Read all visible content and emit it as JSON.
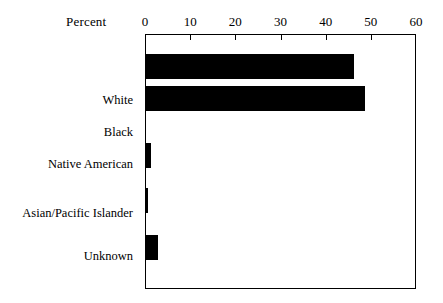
{
  "chart_data": {
    "type": "bar",
    "orientation": "horizontal",
    "title": "",
    "subtitle": "",
    "xlabel": "Percent",
    "ylabel": "",
    "categories": [
      "White",
      "Black",
      "Native American",
      "Asian/Pacific Islander",
      "Unknown"
    ],
    "values": [
      46.4,
      48.8,
      1.1,
      0.4,
      2.6
    ],
    "series": [
      {
        "name": "Percent",
        "values": [
          46.4,
          48.8,
          1.1,
          0.4,
          2.6
        ]
      }
    ],
    "xlim": [
      0,
      60
    ],
    "xticks": [
      0,
      10,
      20,
      30,
      40,
      50,
      60
    ],
    "xtick_labels": [
      "0",
      "10",
      "20",
      "30",
      "40",
      "50",
      "60"
    ],
    "grid": false,
    "legend": false,
    "legend_position": "none",
    "axis_position": "top",
    "bar_color": "#000000",
    "frame_color": "#000000",
    "background_color": "#ffffff",
    "annotations": []
  },
  "axis": {
    "percent_label": "Percent",
    "tick_0": "0",
    "tick_10": "10",
    "tick_20": "20",
    "tick_30": "30",
    "tick_40": "40",
    "tick_50": "50",
    "tick_60": "60"
  },
  "categories": {
    "white": "White",
    "black": "Black",
    "native_american": "Native American",
    "asian_pacific_islander": "Asian/Pacific Islander",
    "unknown": "Unknown"
  }
}
